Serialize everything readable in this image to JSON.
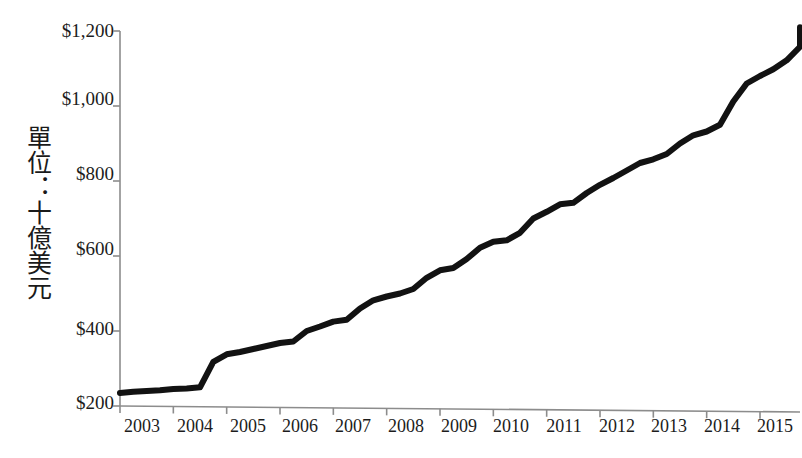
{
  "chart_data": {
    "type": "line",
    "title": "",
    "subtitle": "",
    "xlabel": "",
    "ylabel": "單位：十億美元",
    "ylabel_plain": "Unit: Billions of US Dollars",
    "xlim": [
      2003.0,
      2015.75
    ],
    "ylim": [
      200,
      1200
    ],
    "ytick_values": [
      200,
      400,
      600,
      800,
      1000,
      1200
    ],
    "ytick_labels": [
      "$200",
      "$400",
      "$600",
      "$800",
      "$1,000",
      "$1,200"
    ],
    "xtick_labels": [
      "2003",
      "2004",
      "2005",
      "2006",
      "2007",
      "2008",
      "2009",
      "2010",
      "2011",
      "2012",
      "2013",
      "2014",
      "2015"
    ],
    "xtick_values": [
      2003,
      2004,
      2005,
      2006,
      2007,
      2008,
      2009,
      2010,
      2011,
      2012,
      2013,
      2014,
      2015
    ],
    "grid": false,
    "legend": null,
    "legend_position": "none",
    "line_color": "#121212",
    "line_width": 6,
    "axis_color": "#8c8c8c",
    "series": [
      {
        "name": "",
        "x": [
          2003.0,
          2003.25,
          2003.5,
          2003.75,
          2004.0,
          2004.25,
          2004.5,
          2004.75,
          2005.0,
          2005.25,
          2005.5,
          2005.75,
          2006.0,
          2006.25,
          2006.5,
          2006.75,
          2007.0,
          2007.25,
          2007.5,
          2007.75,
          2008.0,
          2008.25,
          2008.5,
          2008.75,
          2009.0,
          2009.25,
          2009.5,
          2009.75,
          2010.0,
          2010.25,
          2010.5,
          2010.75,
          2011.0,
          2011.25,
          2011.5,
          2011.75,
          2012.0,
          2012.25,
          2012.5,
          2012.75,
          2013.0,
          2013.25,
          2013.5,
          2013.75,
          2014.0,
          2014.25,
          2014.5,
          2014.75,
          2015.0,
          2015.25,
          2015.5,
          2015.75
        ],
        "values": [
          235,
          238,
          240,
          242,
          245,
          247,
          250,
          318,
          338,
          344,
          352,
          360,
          368,
          372,
          400,
          412,
          425,
          430,
          460,
          482,
          492,
          500,
          512,
          542,
          562,
          568,
          592,
          622,
          638,
          642,
          662,
          700,
          718,
          738,
          742,
          768,
          790,
          808,
          828,
          848,
          858,
          872,
          900,
          922,
          932,
          950,
          1012,
          1060,
          1080,
          1098,
          1122,
          1158
        ],
        "end_value": 1210
      }
    ]
  },
  "axis": {
    "y_title": "單位：十億美元"
  }
}
